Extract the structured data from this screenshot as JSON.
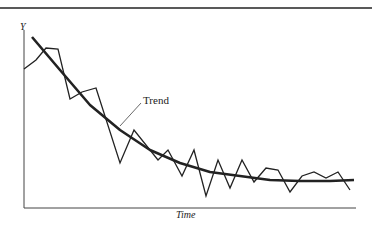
{
  "chart_data": {
    "type": "line",
    "title": "",
    "xlabel": "Time",
    "ylabel": "Y",
    "grid": false,
    "legend": null,
    "annotations": [
      {
        "text": "Trend",
        "points_to": "trend curve"
      }
    ],
    "axis_ticks": {
      "x": [],
      "y": []
    },
    "series": [
      {
        "name": "Observed",
        "style": "thin zigzag",
        "points_px": [
          [
            24,
            69
          ],
          [
            36,
            60
          ],
          [
            46,
            48
          ],
          [
            58,
            49
          ],
          [
            70,
            99
          ],
          [
            82,
            92
          ],
          [
            96,
            88
          ],
          [
            120,
            163
          ],
          [
            134,
            130
          ],
          [
            158,
            160
          ],
          [
            168,
            150
          ],
          [
            182,
            176
          ],
          [
            194,
            150
          ],
          [
            206,
            196
          ],
          [
            218,
            160
          ],
          [
            230,
            188
          ],
          [
            242,
            160
          ],
          [
            254,
            182
          ],
          [
            266,
            168
          ],
          [
            278,
            170
          ],
          [
            290,
            192
          ],
          [
            302,
            176
          ],
          [
            314,
            172
          ],
          [
            326,
            178
          ],
          [
            338,
            172
          ],
          [
            350,
            190
          ]
        ]
      },
      {
        "name": "Trend",
        "style": "thick smooth decaying curve",
        "points_px": [
          [
            32,
            37
          ],
          [
            60,
            70
          ],
          [
            90,
            105
          ],
          [
            120,
            130
          ],
          [
            150,
            150
          ],
          [
            180,
            163
          ],
          [
            210,
            172
          ],
          [
            240,
            176
          ],
          [
            270,
            180
          ],
          [
            300,
            181
          ],
          [
            330,
            181
          ],
          [
            354,
            180
          ]
        ]
      }
    ],
    "axis_px": {
      "origin": [
        24,
        208
      ],
      "x_end": 356,
      "y_top": 30
    }
  },
  "labels": {
    "y_axis": "Y",
    "x_axis": "Time",
    "trend": "Trend"
  }
}
